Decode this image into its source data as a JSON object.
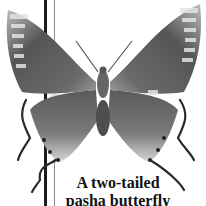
{
  "image": {
    "subject": "two-tailed pasha butterfly specimen, dorsal view, grayscale",
    "caption": {
      "line1": "A two-tailed",
      "line2": "pasha butterfly"
    },
    "colors": {
      "background": "#ffffff",
      "wing_dark": "#4a4a4a",
      "wing_mid": "#7a7a7a",
      "wing_light": "#c8c8c8",
      "text": "#111111"
    }
  }
}
